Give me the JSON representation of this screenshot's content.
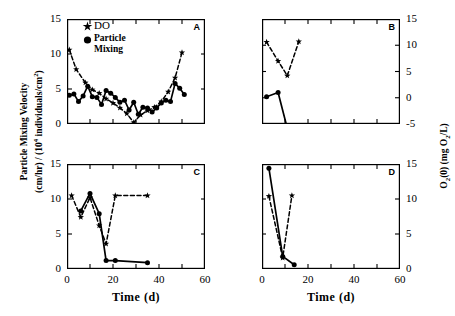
{
  "figure": {
    "axis_labels": {
      "x": "Time  (d)",
      "y_left_line1": "Particle Mixing Velocity",
      "y_left_line2": "(cm/hr) / (10",
      "y_left_exp": "4",
      "y_left_line3": " individuals/cm",
      "y_left_exp2": "2",
      "y_left_close": ")",
      "y_right_pre": "O",
      "y_right_sub1": "2",
      "y_right_mid": "(0)  (mg O",
      "y_right_sub2": "2",
      "y_right_end": "/L)"
    },
    "legend": {
      "do_marker": "star-marker",
      "do_label": "DO",
      "mix_marker": "circle-marker",
      "mix_label_line1": "Particle",
      "mix_label_line2": "Mixing"
    },
    "panels": [
      {
        "tag": "A",
        "x_ticks": [
          0,
          10,
          20,
          30,
          40,
          50,
          60
        ],
        "x_tick_labels": [
          "",
          "",
          "",
          "",
          "",
          "",
          ""
        ],
        "y_ticks": [
          0,
          5,
          10,
          15
        ],
        "y_tick_labels": [
          "0",
          "5",
          "10",
          "15"
        ],
        "y_side": "left",
        "show_x_labels": false
      },
      {
        "tag": "B",
        "x_ticks": [
          0,
          10,
          20,
          30,
          40,
          50,
          60
        ],
        "x_tick_labels": [
          "",
          "",
          "",
          "",
          "",
          "",
          ""
        ],
        "y_ticks": [
          -5,
          0,
          5,
          10,
          15
        ],
        "y_tick_labels": [
          "-5",
          "0",
          "5",
          "10",
          "15"
        ],
        "y_side": "right",
        "show_x_labels": false
      },
      {
        "tag": "C",
        "x_ticks": [
          0,
          10,
          20,
          30,
          40,
          50,
          60
        ],
        "x_tick_labels": [
          "0",
          "",
          "20",
          "",
          "40",
          "",
          "60"
        ],
        "y_ticks": [
          0,
          5,
          10,
          15
        ],
        "y_tick_labels": [
          "0",
          "5",
          "10",
          "15"
        ],
        "y_side": "left",
        "show_x_labels": true
      },
      {
        "tag": "D",
        "x_ticks": [
          0,
          10,
          20,
          30,
          40,
          50,
          60
        ],
        "x_tick_labels": [
          "0",
          "",
          "20",
          "",
          "40",
          "",
          "60"
        ],
        "y_ticks": [
          0,
          5,
          10,
          15
        ],
        "y_tick_labels": [
          "0",
          "5",
          "10",
          "15"
        ],
        "y_side": "right",
        "show_x_labels": true
      }
    ]
  },
  "chart_data": [
    {
      "type": "line",
      "panel": "A",
      "title": "A",
      "xlabel": "Time (d)",
      "ylabel_left": "Particle Mixing Velocity (cm/hr) / (10^4 individuals/cm^2)",
      "xlim": [
        0,
        60
      ],
      "ylim_left": [
        0,
        15
      ],
      "ylim_right": [
        0,
        15
      ],
      "grid": false,
      "legend_position": "top-left",
      "series": [
        {
          "name": "DO",
          "axis": "right",
          "marker": "star",
          "linestyle": "dashed",
          "x": [
            1,
            4,
            8,
            11,
            14,
            17,
            20,
            23,
            26,
            29,
            32,
            35,
            38,
            41,
            44,
            47,
            50
          ],
          "y": [
            10.6,
            7.8,
            5.9,
            4.9,
            4.4,
            3.6,
            3.0,
            2.3,
            1.5,
            0.2,
            1.3,
            1.9,
            2.4,
            3.2,
            4.6,
            6.6,
            10.2
          ]
        },
        {
          "name": "Particle Mixing",
          "axis": "left",
          "marker": "circle",
          "linestyle": "solid",
          "x": [
            1,
            3,
            5,
            7,
            9,
            11,
            13,
            15,
            17,
            19,
            21,
            23,
            25,
            27,
            29,
            31,
            33,
            35,
            37,
            39,
            41,
            43,
            45,
            47,
            49,
            51
          ],
          "y": [
            4.1,
            4.3,
            3.2,
            4.0,
            5.4,
            3.9,
            3.8,
            2.8,
            4.8,
            4.4,
            3.8,
            3.1,
            3.4,
            2.0,
            3.1,
            1.4,
            2.4,
            2.3,
            1.7,
            2.3,
            3.0,
            3.4,
            3.2,
            5.8,
            5.1,
            4.2
          ]
        }
      ]
    },
    {
      "type": "line",
      "panel": "B",
      "title": "B",
      "xlabel": "Time (d)",
      "ylabel_right": "O2(0) (mg O2/L)",
      "xlim": [
        0,
        60
      ],
      "ylim_left": [
        0,
        15
      ],
      "ylim_right": [
        -5,
        15
      ],
      "grid": false,
      "legend_position": "none",
      "series": [
        {
          "name": "DO",
          "axis": "right",
          "marker": "star",
          "linestyle": "dashed",
          "x": [
            2,
            7,
            11,
            16
          ],
          "y": [
            10.6,
            7.0,
            4.2,
            10.7
          ]
        },
        {
          "name": "Particle Mixing",
          "axis": "left",
          "marker": "circle",
          "linestyle": "solid",
          "x": [
            2,
            7,
            12,
            16
          ],
          "y": [
            3.9,
            4.5,
            -1.9,
            -0.4
          ]
        }
      ]
    },
    {
      "type": "line",
      "panel": "C",
      "title": "C",
      "xlabel": "Time (d)",
      "ylabel_left": "Particle Mixing Velocity (cm/hr) / (10^4 individuals/cm^2)",
      "xlim": [
        0,
        60
      ],
      "ylim_left": [
        0,
        15
      ],
      "ylim_right": [
        0,
        15
      ],
      "grid": false,
      "legend_position": "none",
      "series": [
        {
          "name": "DO",
          "axis": "right",
          "marker": "star",
          "linestyle": "dashed",
          "x": [
            2,
            6,
            10,
            14,
            17,
            21,
            35
          ],
          "y": [
            10.5,
            7.4,
            10.2,
            6.2,
            3.6,
            10.5,
            10.5
          ]
        },
        {
          "name": "Particle Mixing",
          "axis": "left",
          "marker": "circle",
          "linestyle": "solid",
          "x": [
            6,
            10,
            14,
            17,
            21,
            35
          ],
          "y": [
            8.3,
            10.8,
            7.9,
            1.2,
            1.2,
            0.9
          ]
        }
      ]
    },
    {
      "type": "line",
      "panel": "D",
      "title": "D",
      "xlabel": "Time (d)",
      "ylabel_right": "O2(0) (mg O2/L)",
      "xlim": [
        0,
        60
      ],
      "ylim_left": [
        0,
        15
      ],
      "ylim_right": [
        0,
        15
      ],
      "grid": false,
      "legend_position": "none",
      "series": [
        {
          "name": "DO",
          "axis": "right",
          "marker": "star",
          "linestyle": "dashed",
          "x": [
            3,
            9,
            13
          ],
          "y": [
            10.4,
            1.6,
            10.5
          ]
        },
        {
          "name": "Particle Mixing",
          "axis": "left",
          "marker": "circle",
          "linestyle": "solid",
          "x": [
            3,
            9,
            14
          ],
          "y": [
            14.4,
            1.8,
            0.6
          ]
        }
      ]
    }
  ]
}
